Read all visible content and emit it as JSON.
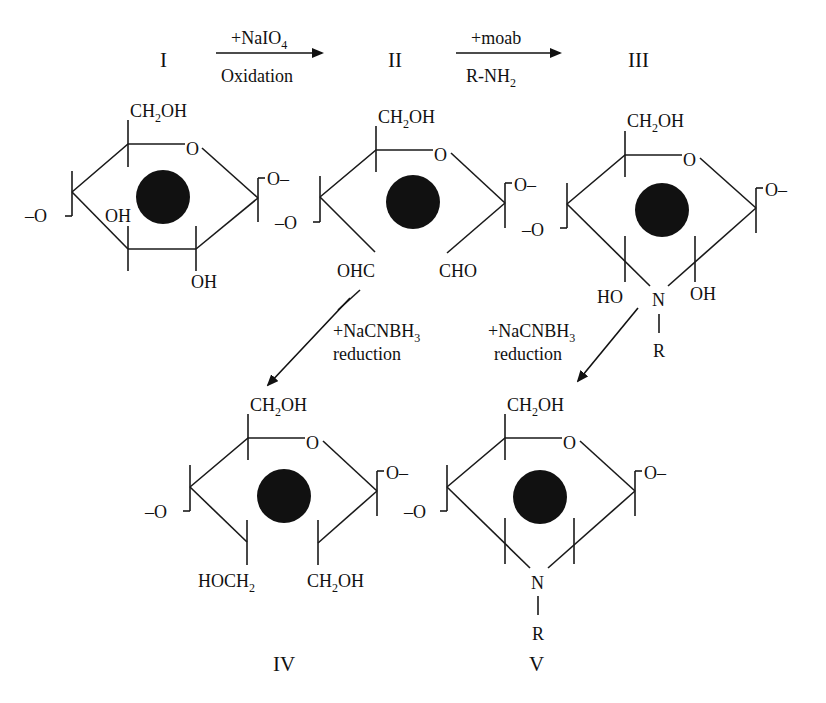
{
  "compounds": {
    "I": "I",
    "II": "II",
    "III": "III",
    "IV": "IV",
    "V": "V"
  },
  "reactions": {
    "step1": {
      "reagent": "+NaIO",
      "reagent_sub": "4",
      "condition": "Oxidation"
    },
    "step2": {
      "reagent": "+moab",
      "condition": "R-NH",
      "condition_sub": "2"
    },
    "step3": {
      "reagent": "+NaCNBH",
      "reagent_sub": "3",
      "condition": "reduction"
    },
    "step4": {
      "reagent": "+NaCNBH",
      "reagent_sub": "3",
      "condition": "reduction"
    }
  },
  "groups": {
    "ch2oh_a": "CH",
    "ch2oh_sub": "2",
    "ch2oh_b": "OH",
    "ring_o": "O",
    "link_right": "O–",
    "link_left": "–O",
    "oh": "OH",
    "ho": "HO",
    "ohc": "OHC",
    "cho": "CHO",
    "n": "N",
    "r": "R",
    "hoch2_a": "HOCH",
    "hoch2_sub": "2"
  },
  "colors": {
    "ink": "#111111",
    "background": "#ffffff"
  }
}
